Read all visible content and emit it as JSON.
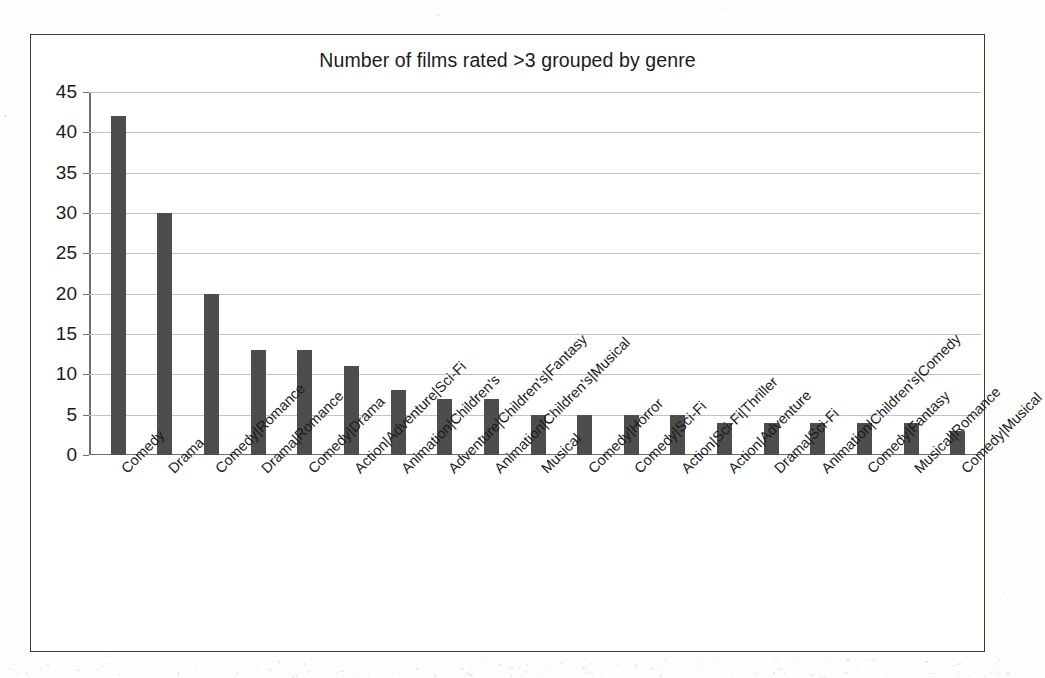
{
  "chart_data": {
    "type": "bar",
    "title": "Number of films rated >3 grouped by genre",
    "xlabel": "",
    "ylabel": "",
    "ylim": [
      0,
      45
    ],
    "yticks": [
      0,
      5,
      10,
      15,
      20,
      25,
      30,
      35,
      40,
      45
    ],
    "ytick_labels": [
      "0",
      "5",
      "10",
      "15",
      "20",
      "25",
      "30",
      "35",
      "40",
      "45"
    ],
    "grid": true,
    "legend": "none",
    "bar_color": "#4d4d4d",
    "categories": [
      "Comedy",
      "Drama",
      "Comedy|Romance",
      "Drama|Romance",
      "Comedy|Drama",
      "Action|Adventure|Sci-Fi",
      "Animation|Children's",
      "Adventure|Children's|Fantasy",
      "Animation|Children's|Musical",
      "Musical",
      "Comedy|Horror",
      "Comedy|Sci-Fi",
      "Action|Sci-Fi|Thriller",
      "Action|Adventure",
      "Drama|Sci-Fi",
      "Animation|Children's|Comedy",
      "Comedy|Fantasy",
      "Musical|Romance",
      "Comedy|Musical"
    ],
    "values": [
      42,
      30,
      20,
      13,
      13,
      11,
      8,
      7,
      7,
      5,
      5,
      5,
      5,
      4,
      4,
      4,
      4,
      4,
      3
    ]
  }
}
